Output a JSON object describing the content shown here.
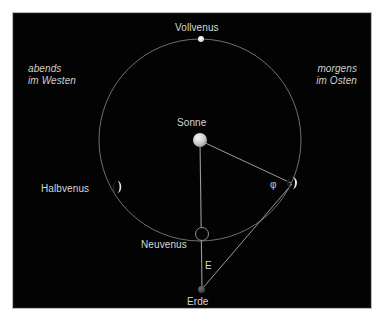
{
  "figure": {
    "title_text": null,
    "background_color": "#030303",
    "frame_color": "#ffffff",
    "line_color": "#8a8a8a",
    "text_color": "#d6d6d6"
  },
  "annotations": {
    "evening_line1": "abends",
    "evening_line2": "im Westen",
    "morning_line1": "morgens",
    "morning_line2": "im Osten"
  },
  "bodies": {
    "sun": {
      "label": "Sonne",
      "x": 200,
      "y": 140,
      "radius": 7,
      "color": "#dcdcdc"
    },
    "full_venus": {
      "label": "Vollvenus",
      "x": 201,
      "y": 39,
      "radius": 3,
      "phase": "full"
    },
    "half_venus": {
      "label": "Halbvenus",
      "x": 118,
      "y": 188,
      "radius": 5,
      "phase": "half"
    },
    "new_venus": {
      "label": "Neuvenus",
      "x": 202,
      "y": 234,
      "radius": 7,
      "phase": "new"
    },
    "elongation_venus": {
      "label": "",
      "x": 292,
      "y": 183,
      "radius": 5,
      "phase": "half"
    },
    "earth": {
      "label": "Erde",
      "x": 202,
      "y": 290,
      "radius": 3.5,
      "color": "#4a4a4a"
    }
  },
  "orbit": {
    "center_x": 200,
    "center_y": 140,
    "radius": 101,
    "stroke": "#7e7e7e"
  },
  "measures": {
    "elongation_symbol": "E",
    "phase_angle_symbol": "φ"
  },
  "segments": [
    {
      "name": "sun-to-earth",
      "x1": 200,
      "y1": 140,
      "x2": 202,
      "y2": 290
    },
    {
      "name": "sun-to-venus",
      "x1": 200,
      "y1": 140,
      "x2": 292,
      "y2": 183
    },
    {
      "name": "earth-to-venus",
      "x1": 202,
      "y1": 290,
      "x2": 292,
      "y2": 183
    }
  ]
}
